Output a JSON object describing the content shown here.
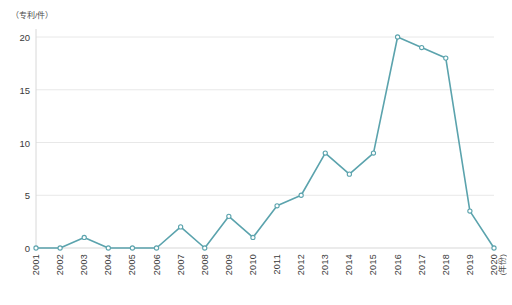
{
  "chart_data": {
    "type": "line",
    "title": "",
    "subtitle": "",
    "xlabel": "(年份)",
    "ylabel": "（专利/件）",
    "categories": [
      "2001",
      "2002",
      "2003",
      "2004",
      "2005",
      "2006",
      "2007",
      "2008",
      "2009",
      "2010",
      "2011",
      "2012",
      "2013",
      "2014",
      "2015",
      "2016",
      "2017",
      "2018",
      "2019",
      "2020"
    ],
    "values": [
      0,
      0,
      1,
      0,
      0,
      0,
      2,
      0,
      3,
      1,
      4,
      5,
      9,
      7,
      9,
      20,
      19,
      18,
      3.5,
      0
    ],
    "series": [
      {
        "name": "专利申请量",
        "values": [
          0,
          0,
          1,
          0,
          0,
          0,
          2,
          0,
          3,
          1,
          4,
          5,
          9,
          7,
          9,
          20,
          19,
          18,
          3.5,
          0
        ]
      }
    ],
    "ylim": [
      0,
      21.5
    ],
    "yticks": [
      0,
      5,
      10,
      15,
      20
    ],
    "ytick_labels": [
      "0",
      "5",
      "10",
      "15",
      "20"
    ],
    "grid": true,
    "grid_axis": "y",
    "legend": false,
    "legend_position": "none",
    "line_color": "#5ba3ad",
    "marker": "circle",
    "marker_face_color": "#ffffff",
    "grid_color": "#e8e8e8",
    "axis_color": "#d8d8d8"
  },
  "caption": {
    "text": ""
  }
}
